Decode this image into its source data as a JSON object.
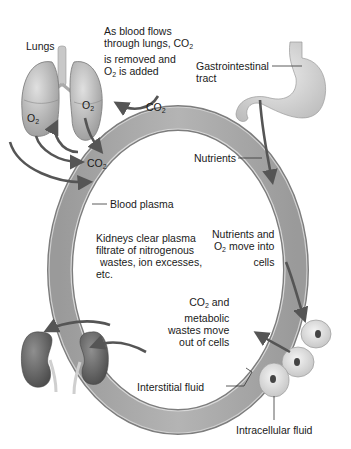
{
  "labels": {
    "lungs": "Lungs",
    "lungs_note_line1": "As blood flows",
    "lungs_note_line2": "through lungs, CO",
    "lungs_note_line2_sub": "2",
    "lungs_note_line3": "is removed and",
    "lungs_note_line4": "O",
    "lungs_note_line4_sub": "2",
    "lungs_note_line4_rest": " is added",
    "gi_line1": "Gastrointestinal",
    "gi_line2": "tract",
    "nutrients": "Nutrients",
    "blood_plasma": "Blood plasma",
    "kidneys_line1": "Kidneys clear plasma",
    "kidneys_line2": "filtrate of nitrogenous",
    "kidneys_line3": "wastes, ion excesses,",
    "kidneys_line4": "etc.",
    "nutrients_o2_line1": "Nutrients and",
    "nutrients_o2_line2a": "O",
    "nutrients_o2_line2sub": "2",
    "nutrients_o2_line2b": " move into",
    "nutrients_o2_line3": "cells",
    "co2_wastes_line1a": "CO",
    "co2_wastes_line1sub": "2",
    "co2_wastes_line1b": " and",
    "co2_wastes_line2": "metabolic",
    "co2_wastes_line3": "wastes move",
    "co2_wastes_line4": "out of cells",
    "interstitial": "Interstitial fluid",
    "intracellular": "Intracellular fluid"
  },
  "gas_labels": [
    {
      "id": "o2-left-lung",
      "base": "O",
      "sub": "2"
    },
    {
      "id": "o2-right-lung",
      "base": "O",
      "sub": "2"
    },
    {
      "id": "co2-top",
      "base": "CO",
      "sub": "2"
    },
    {
      "id": "co2-mid",
      "base": "CO",
      "sub": "2"
    }
  ],
  "colors": {
    "ring_outer": "#8a8a8a",
    "ring_fill": "#a9a9a9",
    "ring_inner_edge": "#cfcfcf",
    "organ_fill": "#c9c9c9",
    "kidney_fill": "#6f6f6f",
    "arrow": "#5a5a5a",
    "cell_fill": "#e2e2e2",
    "nucleus": "#4a4a4a"
  }
}
